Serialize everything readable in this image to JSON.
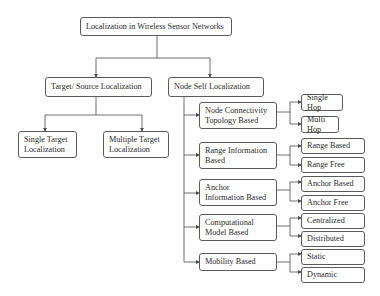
{
  "diagram": {
    "root": {
      "label": "Localization in Wireless Sensor Networks"
    },
    "branches": [
      {
        "label": "Target/ Source Localization",
        "children": [
          {
            "label": "Single Target\nLocalization"
          },
          {
            "label": "Multiple Target\nLocalization"
          }
        ]
      },
      {
        "label": "Node Self Localization",
        "children": [
          {
            "label": "Node Connectivity\nTopology Based",
            "children": [
              {
                "label": "Single Hop"
              },
              {
                "label": "Multi Hop"
              }
            ]
          },
          {
            "label": "Range Information\nBased",
            "children": [
              {
                "label": "Range Based"
              },
              {
                "label": "Range Free"
              }
            ]
          },
          {
            "label": "Anchor\nInformation Based",
            "children": [
              {
                "label": "Anchor Based"
              },
              {
                "label": "Anchor Free"
              }
            ]
          },
          {
            "label": "Computational\nModel Based",
            "children": [
              {
                "label": "Centralized"
              },
              {
                "label": "Distributed"
              }
            ]
          },
          {
            "label": "Mobility Based",
            "children": [
              {
                "label": "Static"
              },
              {
                "label": "Dynamic"
              }
            ]
          }
        ]
      }
    ]
  },
  "colors": {
    "line": "#4a4a4a",
    "border": "#5a5a5a",
    "text": "#2a2a2a",
    "background": "#ffffff"
  }
}
